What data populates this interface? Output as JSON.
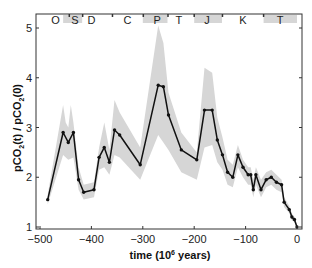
{
  "chart_data": {
    "type": "line",
    "title": "",
    "xlabel": "time (10^6 years)",
    "xlabel_main": "time (10",
    "xlabel_sup": "6",
    "xlabel_tail": " years)",
    "ylabel": "pCO2(t) / pCO2(0)",
    "xlim": [
      -510,
      5
    ],
    "ylim": [
      0.95,
      5.3
    ],
    "x_ticks": [
      -500,
      -400,
      -300,
      -200,
      -100,
      0
    ],
    "x_tick_labels": [
      "−500",
      "−400",
      "−300",
      "−200",
      "−100",
      "0"
    ],
    "y_ticks": [
      1,
      2,
      3,
      4,
      5
    ],
    "y_tick_labels": [
      "1",
      "2",
      "3",
      "4",
      "5"
    ],
    "grid": false,
    "legend": null,
    "period_labels": [
      {
        "label": "O",
        "x": -470
      },
      {
        "label": "S",
        "x": -432
      },
      {
        "label": "D",
        "x": -400
      },
      {
        "label": "C",
        "x": -330
      },
      {
        "label": "P",
        "x": -272
      },
      {
        "label": "T",
        "x": -230
      },
      {
        "label": "J",
        "x": -175
      },
      {
        "label": "K",
        "x": -105
      },
      {
        "label": "T",
        "x": -33
      }
    ],
    "period_boundaries": [
      -443,
      -417,
      -359,
      -299,
      -251,
      -200,
      -145,
      -65
    ],
    "series": [
      {
        "name": "pCO2 ratio",
        "color": "#111111",
        "x": [
          -485,
          -455,
          -445,
          -435,
          -425,
          -415,
          -395,
          -385,
          -375,
          -365,
          -355,
          -345,
          -305,
          -270,
          -260,
          -250,
          -225,
          -195,
          -180,
          -165,
          -155,
          -145,
          -135,
          -125,
          -115,
          -105,
          -95,
          -90,
          -85,
          -80,
          -70,
          -60,
          -50,
          -40,
          -30,
          -25,
          -15,
          -10,
          -5,
          0
        ],
        "values": [
          1.55,
          2.9,
          2.7,
          2.9,
          1.95,
          1.7,
          1.75,
          2.4,
          2.6,
          2.3,
          2.95,
          2.85,
          2.25,
          3.85,
          3.82,
          3.25,
          2.55,
          2.35,
          3.35,
          3.35,
          2.75,
          2.45,
          2.1,
          2.0,
          2.45,
          2.2,
          2.05,
          2.05,
          1.75,
          2.05,
          1.75,
          1.95,
          2.0,
          1.9,
          1.85,
          1.5,
          1.35,
          1.2,
          1.15,
          1.0
        ]
      },
      {
        "name": "uncertainty band upper",
        "color": "#d9d9d9",
        "x": [
          -485,
          -455,
          -450,
          -445,
          -440,
          -435,
          -425,
          -415,
          -395,
          -385,
          -375,
          -365,
          -355,
          -345,
          -305,
          -270,
          -260,
          -250,
          -225,
          -195,
          -180,
          -165,
          -155,
          -145,
          -135,
          -125,
          -115,
          -105,
          -95,
          -90,
          -85,
          -80,
          -70,
          -60,
          -50,
          -40,
          -30,
          -25,
          -15,
          -10,
          -5,
          0
        ],
        "values": [
          1.65,
          3.45,
          3.1,
          3.0,
          3.45,
          3.1,
          2.2,
          1.85,
          1.9,
          2.6,
          3.1,
          2.55,
          3.55,
          3.3,
          2.6,
          5.05,
          4.7,
          3.7,
          2.9,
          2.5,
          4.2,
          4.1,
          3.2,
          2.8,
          2.35,
          2.25,
          2.65,
          2.35,
          2.2,
          2.2,
          1.95,
          2.2,
          1.95,
          2.1,
          2.15,
          2.05,
          1.95,
          1.6,
          1.42,
          1.27,
          1.2,
          1.05
        ]
      },
      {
        "name": "uncertainty band lower",
        "color": "#d9d9d9",
        "x": [
          -485,
          -455,
          -445,
          -435,
          -425,
          -415,
          -395,
          -385,
          -375,
          -365,
          -355,
          -345,
          -305,
          -270,
          -260,
          -250,
          -225,
          -195,
          -180,
          -165,
          -155,
          -145,
          -135,
          -125,
          -115,
          -105,
          -95,
          -90,
          -85,
          -80,
          -70,
          -60,
          -50,
          -40,
          -30,
          -25,
          -15,
          -10,
          -5,
          0
        ],
        "values": [
          1.45,
          2.45,
          2.35,
          2.4,
          1.75,
          1.55,
          1.6,
          2.15,
          2.2,
          2.05,
          2.45,
          2.4,
          1.95,
          2.85,
          2.7,
          2.55,
          2.1,
          1.95,
          2.6,
          2.65,
          2.3,
          2.15,
          1.85,
          1.8,
          2.2,
          2.0,
          1.85,
          1.85,
          1.6,
          1.85,
          1.6,
          1.8,
          1.85,
          1.75,
          1.7,
          1.4,
          1.28,
          1.13,
          1.1,
          0.97
        ]
      }
    ]
  }
}
